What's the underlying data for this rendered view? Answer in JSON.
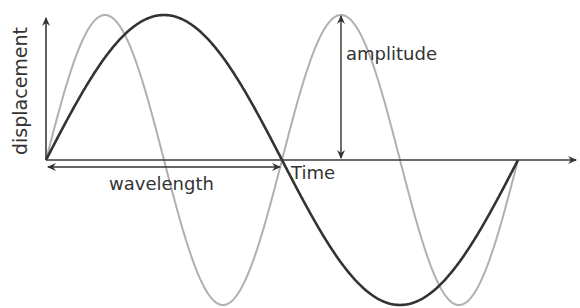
{
  "diagram": {
    "y_axis_label": "displacement",
    "x_axis_label": "Time",
    "amplitude_label": "amplitude",
    "wavelength_label": "wavelength",
    "colors": {
      "axis": "#3a3a3a",
      "wave_primary": "#333333",
      "wave_secondary": "#b0b0b0",
      "text": "#333333",
      "background": "#ffffff"
    },
    "waves": [
      {
        "name": "primary",
        "description": "dark sine wave, one full wavelength shown",
        "cycles_shown": 1
      },
      {
        "name": "secondary",
        "description": "light gray sine wave, double frequency, same amplitude",
        "cycles_shown": 2
      }
    ]
  }
}
